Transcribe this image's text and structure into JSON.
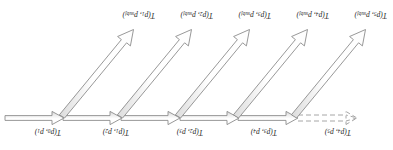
{
  "diagram": {
    "orientation_deg": 180,
    "colors": {
      "stroke": "#8c8c8c",
      "fill_light": "#fdfdfd",
      "fill_shade": "#d9d9d9",
      "text": "#1a1a1a",
      "background": "#ffffff"
    },
    "horizontal_labels": [
      {
        "id": "h0",
        "fn": "T",
        "open": "(",
        "a": "p",
        "a_sub": "0",
        "sep": ", ",
        "b": "p",
        "b_sub": "1",
        "close": ")",
        "text": "T(p0, p1)",
        "x": 332,
        "y": 13
      },
      {
        "id": "h1",
        "fn": "T",
        "open": "(",
        "a": "p",
        "a_sub": "1",
        "sep": ", ",
        "b": "p",
        "b_sub": "2",
        "close": ")",
        "text": "T(p1, p2)",
        "x": 264,
        "y": 13
      },
      {
        "id": "h2",
        "fn": "T",
        "open": "(",
        "a": "p",
        "a_sub": "2",
        "sep": ", ",
        "b": "p",
        "b_sub": "3",
        "close": ")",
        "text": "T(p2, p3)",
        "x": 190,
        "y": 13
      },
      {
        "id": "h3",
        "fn": "T",
        "open": "(",
        "a": "p",
        "a_sub": "3",
        "sep": ", ",
        "b": "p",
        "b_sub": "4",
        "close": ")",
        "text": "T(p3, p4)",
        "x": 116,
        "y": 13
      },
      {
        "id": "h4",
        "fn": "T",
        "open": "(",
        "a": "p",
        "a_sub": "4",
        "sep": ", ",
        "b": "p",
        "b_sub": "5",
        "close": ")",
        "text": "T(p4, p5)",
        "x": 42,
        "y": 13
      }
    ],
    "diagonal_labels": [
      {
        "id": "d0",
        "fn": "T",
        "open": "(",
        "a": "p",
        "a_sub": "1",
        "sep": ", ",
        "b": "p",
        "b_sub": "subj",
        "close": ")",
        "text": "T(p1, psubj)",
        "x": 238,
        "y": 130
      },
      {
        "id": "d1",
        "fn": "T",
        "open": "(",
        "a": "p",
        "a_sub": "2",
        "sep": ", ",
        "b": "p",
        "b_sub": "subj",
        "close": ")",
        "text": "T(p2, psubj)",
        "x": 180,
        "y": 130
      },
      {
        "id": "d2",
        "fn": "T",
        "open": "(",
        "a": "p",
        "a_sub": "3",
        "sep": ", ",
        "b": "p",
        "b_sub": "subj",
        "close": ")",
        "text": "T(p3, psubj)",
        "x": 122,
        "y": 130
      },
      {
        "id": "d3",
        "fn": "T",
        "open": "(",
        "a": "p",
        "a_sub": "4",
        "sep": ", ",
        "b": "p",
        "b_sub": "subj",
        "close": ")",
        "text": "T(p4, psubj)",
        "x": 64,
        "y": 130
      },
      {
        "id": "d4",
        "fn": "T",
        "open": "(",
        "a": "p",
        "a_sub": "5",
        "sep": ", ",
        "b": "p",
        "b_sub": "subj",
        "close": ")",
        "text": "T(p5, psubj)",
        "x": 6,
        "y": 130
      }
    ],
    "arrows": {
      "horizontal_solid_count": 5,
      "horizontal_dashed_count": 1,
      "diagonal_count": 5,
      "direction": "right-to-left"
    }
  }
}
